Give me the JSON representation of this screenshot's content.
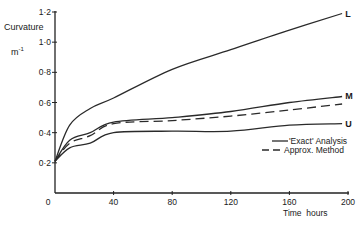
{
  "chart_data": {
    "type": "line",
    "title": "",
    "xlabel": "Time  hours",
    "ylabel": "Curvature",
    "ylabel_unit": "m",
    "ylabel_unit_exp": "-1",
    "xlim": [
      0,
      200
    ],
    "ylim": [
      0,
      1.2
    ],
    "x_ticks": [
      0,
      40,
      80,
      120,
      160,
      200
    ],
    "x_tick_labels": [
      "0",
      "40",
      "80",
      "120",
      "160",
      "200"
    ],
    "y_ticks": [
      0.2,
      0.4,
      0.6,
      0.8,
      1.0,
      1.2
    ],
    "y_tick_labels": [
      "0·2",
      "0·4",
      "0·6",
      "0·8",
      "1·0",
      "1·2"
    ],
    "origin_label": "0",
    "grid": false,
    "x": [
      0,
      10,
      24,
      40,
      80,
      120,
      160,
      196
    ],
    "series": [
      {
        "name": "L",
        "style": "solid",
        "label": "L",
        "values": [
          0.21,
          0.45,
          0.56,
          0.63,
          0.82,
          0.95,
          1.08,
          1.19
        ]
      },
      {
        "name": "M",
        "style": "solid",
        "label": "M",
        "values": [
          0.21,
          0.35,
          0.4,
          0.47,
          0.5,
          0.54,
          0.6,
          0.64
        ]
      },
      {
        "name": "Approx. Method",
        "style": "dashed",
        "label": "",
        "values": [
          0.21,
          0.33,
          0.38,
          0.46,
          0.48,
          0.51,
          0.55,
          0.59
        ]
      },
      {
        "name": "U",
        "style": "solid",
        "label": "U",
        "values": [
          0.21,
          0.3,
          0.33,
          0.4,
          0.41,
          0.41,
          0.45,
          0.46
        ]
      }
    ],
    "legend": [
      {
        "label": "'Exact' Analysis",
        "style": "solid"
      },
      {
        "label": "Approx. Method",
        "style": "dashed"
      }
    ],
    "legend_position": "lower right"
  }
}
